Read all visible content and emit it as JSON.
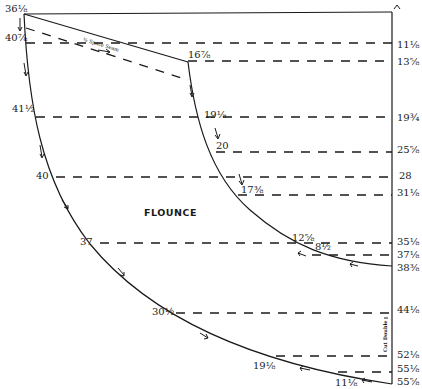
{
  "diagram": {
    "title": "FLOUNCE",
    "seam_note": "⅜ Space Seam",
    "fold_note": "Cut Double",
    "top_marker": "^",
    "right_edge_labels": [
      {
        "text": "11⅛",
        "x": 397,
        "y": 40
      },
      {
        "text": "13⅝",
        "x": 397,
        "y": 57
      },
      {
        "text": "19¾",
        "x": 397,
        "y": 113
      },
      {
        "text": "25⅝",
        "x": 397,
        "y": 145
      },
      {
        "text": "28",
        "x": 399,
        "y": 171
      },
      {
        "text": "31⅛",
        "x": 397,
        "y": 188
      },
      {
        "text": "35⅛",
        "x": 397,
        "y": 237
      },
      {
        "text": "37⅛",
        "x": 397,
        "y": 250
      },
      {
        "text": "38⅜",
        "x": 397,
        "y": 263
      },
      {
        "text": "44⅛",
        "x": 397,
        "y": 305
      },
      {
        "text": "52⅛",
        "x": 397,
        "y": 350
      },
      {
        "text": "55⅛",
        "x": 397,
        "y": 364
      },
      {
        "text": "55⅝",
        "x": 397,
        "y": 377
      }
    ],
    "outer_curve_labels": [
      {
        "text": "36⅛",
        "x": 5,
        "y": 4
      },
      {
        "text": "40⅞",
        "x": 5,
        "y": 33
      },
      {
        "text": "41½",
        "x": 12,
        "y": 104
      },
      {
        "text": "40",
        "x": 36,
        "y": 171
      },
      {
        "text": "37",
        "x": 80,
        "y": 237
      },
      {
        "text": "30½",
        "x": 152,
        "y": 307
      },
      {
        "text": "19⅛",
        "x": 253,
        "y": 361
      },
      {
        "text": "11⅛",
        "x": 335,
        "y": 378
      }
    ],
    "inner_curve_labels": [
      {
        "text": "16⅞",
        "x": 188,
        "y": 50
      },
      {
        "text": "19⅛",
        "x": 204,
        "y": 110
      },
      {
        "text": "20",
        "x": 216,
        "y": 141
      },
      {
        "text": "17⅜",
        "x": 241,
        "y": 185
      },
      {
        "text": "12⅝",
        "x": 292,
        "y": 233
      },
      {
        "text": "8½",
        "x": 315,
        "y": 242
      }
    ]
  }
}
